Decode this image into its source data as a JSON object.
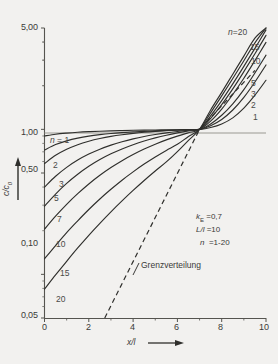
{
  "chart_data": {
    "type": "line",
    "title": "",
    "xlabel": "x/l",
    "ylabel": "c/c0",
    "xlim": [
      0,
      10
    ],
    "ylim": [
      0.05,
      5.0
    ],
    "yscale": "log",
    "xscale": "linear",
    "grid": false,
    "legend_position": "inline-curve-labels",
    "xticks": [
      "0",
      "2",
      "4",
      "6",
      "8",
      "10"
    ],
    "xtick_values": [
      0,
      2,
      4,
      6,
      8,
      10
    ],
    "yticks": [
      "5,00",
      "1,00",
      "0,50",
      "0,10",
      "0,05"
    ],
    "ytick_values": [
      5.0,
      1.0,
      0.5,
      0.1,
      0.05
    ],
    "crossing_point": {
      "x": 7.0,
      "y": 1.0
    },
    "series": [
      {
        "name": "1",
        "label_left": "n = 1",
        "label_right": "1",
        "x": [
          0,
          0.5,
          1,
          1.5,
          2,
          2.5,
          3,
          3.5,
          4,
          4.5,
          5,
          5.5,
          6,
          6.5,
          7,
          7.5,
          8,
          8.5,
          9,
          9.5,
          10
        ],
        "y": [
          0.9,
          0.925,
          0.942,
          0.955,
          0.964,
          0.971,
          0.977,
          0.981,
          0.985,
          0.988,
          0.99,
          0.992,
          0.994,
          0.997,
          1.0,
          1.03,
          1.09,
          1.2,
          1.4,
          1.72,
          2.18
        ]
      },
      {
        "name": "2",
        "label_left": "2",
        "label_right": "2",
        "x": [
          0,
          0.5,
          1,
          1.5,
          2,
          2.5,
          3,
          3.5,
          4,
          4.5,
          5,
          5.5,
          6,
          6.5,
          7,
          7.5,
          8,
          8.5,
          9,
          9.5,
          10
        ],
        "y": [
          0.72,
          0.785,
          0.833,
          0.87,
          0.898,
          0.919,
          0.936,
          0.949,
          0.96,
          0.969,
          0.977,
          0.984,
          0.99,
          0.995,
          1.0,
          1.06,
          1.17,
          1.36,
          1.66,
          2.12,
          2.78
        ]
      },
      {
        "name": "3",
        "label_left": "3",
        "label_right": "3",
        "x": [
          0,
          0.5,
          1,
          1.5,
          2,
          2.5,
          3,
          3.5,
          4,
          4.5,
          5,
          5.5,
          6,
          6.5,
          7,
          7.5,
          8,
          8.5,
          9,
          9.5,
          10
        ],
        "y": [
          0.58,
          0.662,
          0.729,
          0.784,
          0.828,
          0.864,
          0.894,
          0.918,
          0.938,
          0.955,
          0.969,
          0.98,
          0.988,
          0.995,
          1.0,
          1.09,
          1.25,
          1.5,
          1.88,
          2.45,
          3.25
        ]
      },
      {
        "name": "5",
        "label_left": "5",
        "label_right": "5",
        "x": [
          0,
          0.5,
          1,
          1.5,
          2,
          2.5,
          3,
          3.5,
          4,
          4.5,
          5,
          5.5,
          6,
          6.5,
          7,
          7.5,
          8,
          8.5,
          9,
          9.5,
          10
        ],
        "y": [
          0.4,
          0.475,
          0.547,
          0.614,
          0.675,
          0.73,
          0.779,
          0.822,
          0.86,
          0.893,
          0.921,
          0.946,
          0.967,
          0.985,
          1.0,
          1.14,
          1.38,
          1.74,
          2.25,
          2.98,
          3.98
        ]
      },
      {
        "name": "7",
        "label_left": "7",
        "label_right": "",
        "x": [
          0,
          0.5,
          1,
          1.5,
          2,
          2.5,
          3,
          3.5,
          4,
          4.5,
          5,
          5.5,
          6,
          6.5,
          7,
          7.5,
          8,
          8.5,
          9,
          9.5,
          10
        ],
        "y": [
          0.295,
          0.358,
          0.424,
          0.49,
          0.556,
          0.619,
          0.678,
          0.733,
          0.784,
          0.831,
          0.873,
          0.911,
          0.945,
          0.975,
          1.0,
          1.19,
          1.48,
          1.9,
          2.5,
          3.32,
          4.45
        ]
      },
      {
        "name": "10",
        "label_left": "10",
        "label_right": "10",
        "x": [
          0,
          0.5,
          1,
          1.5,
          2,
          2.5,
          3,
          3.5,
          4,
          4.5,
          5,
          5.5,
          6,
          6.5,
          7,
          7.5,
          8,
          8.5,
          9,
          9.5,
          10
        ],
        "y": [
          0.205,
          0.252,
          0.304,
          0.36,
          0.42,
          0.482,
          0.545,
          0.608,
          0.67,
          0.731,
          0.79,
          0.846,
          0.898,
          0.948,
          1.0,
          1.24,
          1.58,
          2.06,
          2.72,
          3.62,
          4.85
        ]
      },
      {
        "name": "15",
        "label_left": "15",
        "label_right": "15",
        "x": [
          0,
          0.5,
          1,
          1.5,
          2,
          2.5,
          3,
          3.5,
          4,
          4.5,
          5,
          5.5,
          6,
          6.5,
          7,
          7.5,
          8,
          8.5,
          9,
          9.5,
          10
        ],
        "y": [
          0.128,
          0.158,
          0.194,
          0.234,
          0.28,
          0.331,
          0.386,
          0.446,
          0.509,
          0.576,
          0.645,
          0.716,
          0.788,
          0.893,
          1.0,
          1.3,
          1.7,
          2.24,
          2.97,
          3.95,
          5.0
        ]
      },
      {
        "name": "20",
        "label_left": "20",
        "label_right": "n = 20",
        "x": [
          0,
          0.5,
          1,
          1.5,
          2,
          2.5,
          3,
          3.5,
          4,
          4.5,
          5,
          5.5,
          6,
          6.5,
          7,
          7.5,
          8,
          8.5,
          9,
          9.5,
          10
        ],
        "y": [
          0.079,
          0.099,
          0.123,
          0.152,
          0.186,
          0.225,
          0.27,
          0.321,
          0.379,
          0.444,
          0.516,
          0.596,
          0.702,
          0.84,
          1.0,
          1.36,
          1.8,
          2.4,
          3.2,
          4.25,
          5.0
        ]
      }
    ],
    "reference_line": {
      "name": "Grenzverteilung",
      "style": "dashed",
      "x": [
        2.72,
        7.0,
        9.5
      ],
      "y": [
        0.05,
        1.0,
        2.55
      ]
    },
    "annotations": {
      "k_E": "k",
      "k_E_sub": "E",
      "k_E_value": "=0,7",
      "Ll": "L/l",
      "Ll_value": "=10",
      "n": "n",
      "n_value": "=1-20"
    }
  },
  "axis": {
    "x_title": "x/l",
    "y_title": "c/c",
    "y_title_sub": "0"
  },
  "reference_label": "Grenzverteilung"
}
